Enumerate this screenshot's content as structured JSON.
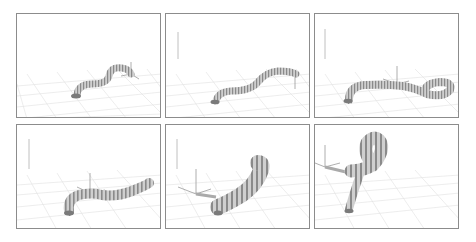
{
  "figure": {
    "layout": {
      "rows": 2,
      "cols": 3
    },
    "panels": [
      {
        "id": 1,
        "description": "snake-like continuum robot, S-curve, tip near axes",
        "x": 16,
        "y": 13
      },
      {
        "id": 2,
        "description": "robot extended in longer S-curve, tip at axes",
        "x": 165,
        "y": 13
      },
      {
        "id": 3,
        "description": "robot curling into loop near axes",
        "x": 314,
        "y": 13
      },
      {
        "id": 4,
        "description": "robot body thickening, arc through axes",
        "x": 16,
        "y": 124
      },
      {
        "id": 5,
        "description": "robot bent upward, thick segmented arc",
        "x": 165,
        "y": 124
      },
      {
        "id": 6,
        "description": "robot standing and looping over",
        "x": 314,
        "y": 124
      }
    ],
    "colors": {
      "border": "#8c8c8c",
      "grid": "#dcdcdc",
      "robot_light": "#d6d6d6",
      "robot_dark": "#7a7a7a",
      "axis": "#9a9a9a"
    }
  }
}
